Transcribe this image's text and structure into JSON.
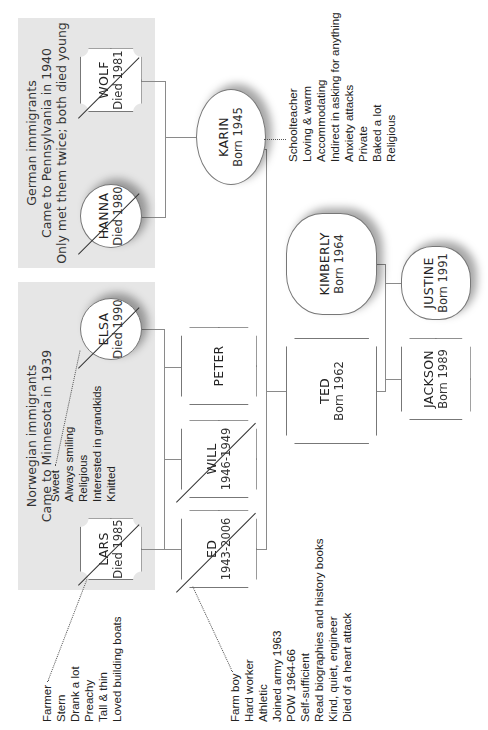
{
  "groups": {
    "norwegian": {
      "lines": [
        "Norwegian immigrants",
        "Came to Minnesota in 1939"
      ]
    },
    "german": {
      "lines": [
        "German immigrants",
        "Came to Pennsylvania in 1940",
        "Only met them twice; both died young"
      ]
    }
  },
  "people": {
    "lars": {
      "name": "LARS",
      "date": "Died 1985",
      "sex": "male",
      "deceased": true
    },
    "elsa": {
      "name": "ELSA",
      "date": "Died 1990",
      "sex": "female",
      "deceased": true
    },
    "hanna": {
      "name": "HANNA",
      "date": "Died 1980",
      "sex": "female",
      "deceased": true
    },
    "wolf": {
      "name": "WOLF",
      "date": "Died 1981",
      "sex": "male",
      "deceased": true
    },
    "ed": {
      "name": "ED",
      "date": "1943-2006",
      "sex": "male",
      "deceased": true
    },
    "will": {
      "name": "WILL",
      "date": "1946-1949",
      "sex": "male",
      "deceased": true
    },
    "peter": {
      "name": "PETER",
      "date": "",
      "sex": "male",
      "deceased": false
    },
    "karin": {
      "name": "KARIN",
      "date": "Born 1945",
      "sex": "female",
      "deceased": false
    },
    "ted": {
      "name": "TED",
      "date": "Born 1962",
      "sex": "male",
      "deceased": false
    },
    "kimberly": {
      "name": "KIMBERLY",
      "date": "Born 1964",
      "sex": "female",
      "deceased": false
    },
    "jackson": {
      "name": "JACKSON",
      "date": "Born 1989",
      "sex": "male",
      "deceased": false
    },
    "justine": {
      "name": "JUSTINE",
      "date": "Born 1991",
      "sex": "female",
      "deceased": false
    }
  },
  "notes": {
    "lars": [
      "Farmer",
      "Stern",
      "Drank a lot",
      "Preachy",
      "Tall & thin",
      "Loved building boats"
    ],
    "elsa": [
      "Sweet",
      "Always smiling",
      "Religious",
      "Interested in grandkids",
      "Knitted"
    ],
    "ed": [
      "Farm boy",
      "Hard worker",
      "Athletic",
      "Joined army 1963",
      "POW 1964-66",
      "Self-sufficient",
      "Read biographies and history books",
      "Kind, quiet, engineer",
      "Died of a heart attack"
    ],
    "karin": [
      "Schoolteacher",
      "Loving & warm",
      "Accommodating",
      "Indirect in asking for anything",
      "Anxiety attacks",
      "Private",
      "Baked a lot",
      "Religious"
    ]
  },
  "colors": {
    "group_shade": "#e6e6e6",
    "line": "#8a8a8a",
    "node_fill": "#ffffff"
  }
}
